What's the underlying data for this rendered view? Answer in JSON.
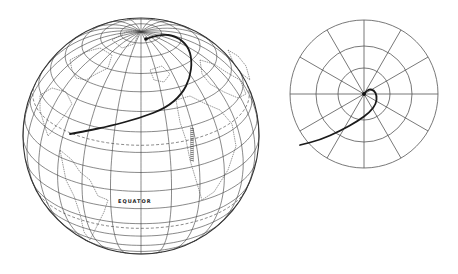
{
  "figure": {
    "background": "#ffffff",
    "line_color": "#3a3a3a",
    "path_color": "#1a1a1a"
  },
  "globe": {
    "center": [
      141,
      136
    ],
    "radius": 118,
    "tilt_deg": 62,
    "meridian_step_deg": 15,
    "parallel_step_deg": 10,
    "equator_label": "EQUATOR",
    "dashed_parallels": [
      23.5,
      -23.5
    ],
    "trajectory": [
      [
        146,
        39
      ],
      [
        160,
        34
      ],
      [
        176,
        36
      ],
      [
        188,
        46
      ],
      [
        192,
        60
      ],
      [
        190,
        78
      ],
      [
        182,
        94
      ],
      [
        166,
        108
      ],
      [
        140,
        118
      ],
      [
        110,
        126
      ],
      [
        86,
        131
      ],
      [
        70,
        134
      ]
    ]
  },
  "polar_plot": {
    "center": [
      364,
      94
    ],
    "ring_radii": [
      26,
      48,
      74
    ],
    "spoke_count": 12,
    "trajectory": [
      [
        364,
        94
      ],
      [
        368,
        89
      ],
      [
        374,
        90
      ],
      [
        377,
        96
      ],
      [
        376,
        104
      ],
      [
        370,
        112
      ],
      [
        358,
        121
      ],
      [
        340,
        131
      ],
      [
        320,
        140
      ],
      [
        300,
        145
      ]
    ]
  }
}
